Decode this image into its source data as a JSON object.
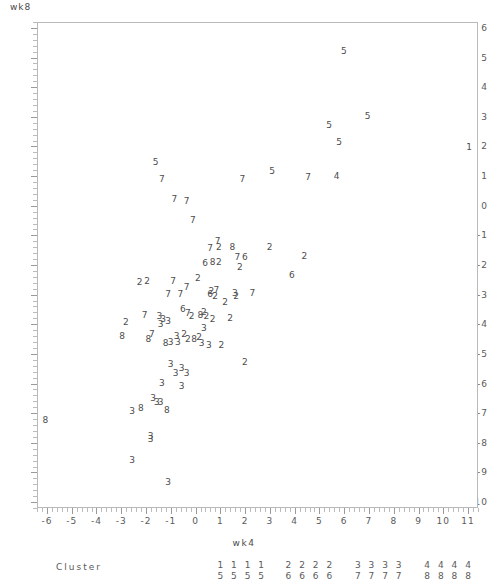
{
  "chart_data": {
    "type": "scatter",
    "title": "",
    "xlabel": "wk4",
    "ylabel": "wk8",
    "xlim": [
      -6.4,
      11.4
    ],
    "ylim": [
      -10.2,
      6.2
    ],
    "grid": false,
    "legend_position": "below-axis",
    "x_ticks": [
      -6,
      -5,
      -4,
      -3,
      -2,
      -1,
      0,
      1,
      2,
      3,
      4,
      5,
      6,
      7,
      8,
      9,
      10,
      11
    ],
    "y_ticks": [
      6,
      5,
      4,
      3,
      2,
      1,
      0,
      -1,
      -2,
      -3,
      -4,
      -5,
      -6,
      -7,
      -8,
      -9,
      -10
    ],
    "marker_style": "cluster-number-glyph",
    "legend": {
      "label": "Cluster",
      "entries": [
        {
          "top": "1",
          "bottom": "5"
        },
        {
          "top": "1",
          "bottom": "5"
        },
        {
          "top": "1",
          "bottom": "5"
        },
        {
          "top": "1",
          "bottom": "5"
        },
        {
          "top": "2",
          "bottom": "6"
        },
        {
          "top": "2",
          "bottom": "6"
        },
        {
          "top": "2",
          "bottom": "6"
        },
        {
          "top": "2",
          "bottom": "6"
        },
        {
          "top": "3",
          "bottom": "7"
        },
        {
          "top": "3",
          "bottom": "7"
        },
        {
          "top": "3",
          "bottom": "7"
        },
        {
          "top": "3",
          "bottom": "7"
        },
        {
          "top": "4",
          "bottom": "8"
        },
        {
          "top": "4",
          "bottom": "8"
        },
        {
          "top": "4",
          "bottom": "8"
        },
        {
          "top": "4",
          "bottom": "8"
        }
      ],
      "entry_x": [
        1,
        1.55,
        2.1,
        2.65,
        3.75,
        4.3,
        4.85,
        5.4,
        6.55,
        7.1,
        7.65,
        8.2,
        9.35,
        9.9,
        10.45,
        11.0
      ]
    },
    "points": [
      {
        "x": 11.0,
        "y": 2.0,
        "label": "1"
      },
      {
        "x": 5.95,
        "y": 5.25,
        "label": "5"
      },
      {
        "x": 6.9,
        "y": 3.05,
        "label": "5"
      },
      {
        "x": 5.35,
        "y": 2.75,
        "label": "5"
      },
      {
        "x": 5.75,
        "y": 2.2,
        "label": "5"
      },
      {
        "x": 3.05,
        "y": 1.2,
        "label": "5"
      },
      {
        "x": -1.65,
        "y": 1.5,
        "label": "5"
      },
      {
        "x": 5.65,
        "y": 1.05,
        "label": "4"
      },
      {
        "x": -1.4,
        "y": 0.95,
        "label": "7"
      },
      {
        "x": -0.9,
        "y": 0.25,
        "label": "7"
      },
      {
        "x": -0.4,
        "y": 0.2,
        "label": "7"
      },
      {
        "x": -0.15,
        "y": -0.45,
        "label": "7"
      },
      {
        "x": 1.85,
        "y": 0.95,
        "label": "7"
      },
      {
        "x": 4.5,
        "y": 1.0,
        "label": "7"
      },
      {
        "x": 0.85,
        "y": -1.15,
        "label": "7"
      },
      {
        "x": 0.55,
        "y": -1.4,
        "label": "7"
      },
      {
        "x": 0.9,
        "y": -1.35,
        "label": "2"
      },
      {
        "x": 1.45,
        "y": -1.35,
        "label": "8"
      },
      {
        "x": 1.65,
        "y": -1.7,
        "label": "7"
      },
      {
        "x": 1.95,
        "y": -1.7,
        "label": "6"
      },
      {
        "x": 0.35,
        "y": -1.9,
        "label": "6"
      },
      {
        "x": 0.65,
        "y": -1.85,
        "label": "8"
      },
      {
        "x": 0.9,
        "y": -1.85,
        "label": "2"
      },
      {
        "x": 1.75,
        "y": -2.05,
        "label": "2"
      },
      {
        "x": 2.95,
        "y": -1.35,
        "label": "2"
      },
      {
        "x": 4.35,
        "y": -1.65,
        "label": "2"
      },
      {
        "x": 3.85,
        "y": -2.3,
        "label": "6"
      },
      {
        "x": -2.3,
        "y": -2.55,
        "label": "2"
      },
      {
        "x": -2.0,
        "y": -2.5,
        "label": "2"
      },
      {
        "x": -0.95,
        "y": -2.5,
        "label": "7"
      },
      {
        "x": -1.15,
        "y": -2.95,
        "label": "7"
      },
      {
        "x": -0.65,
        "y": -2.95,
        "label": "7"
      },
      {
        "x": -0.4,
        "y": -2.7,
        "label": "7"
      },
      {
        "x": 0.05,
        "y": -2.4,
        "label": "2"
      },
      {
        "x": 0.6,
        "y": -2.85,
        "label": "2"
      },
      {
        "x": 0.8,
        "y": -2.8,
        "label": "7"
      },
      {
        "x": 0.55,
        "y": -2.95,
        "label": "6"
      },
      {
        "x": 0.75,
        "y": -3.0,
        "label": "2"
      },
      {
        "x": 1.15,
        "y": -3.2,
        "label": "2"
      },
      {
        "x": 1.55,
        "y": -2.9,
        "label": "3"
      },
      {
        "x": 1.6,
        "y": -3.0,
        "label": "2"
      },
      {
        "x": 2.25,
        "y": -2.9,
        "label": "7"
      },
      {
        "x": -2.85,
        "y": -3.9,
        "label": "2"
      },
      {
        "x": -3.0,
        "y": -4.35,
        "label": "8"
      },
      {
        "x": -2.1,
        "y": -3.65,
        "label": "7"
      },
      {
        "x": -1.5,
        "y": -3.7,
        "label": "3"
      },
      {
        "x": -1.35,
        "y": -3.8,
        "label": "3"
      },
      {
        "x": -1.45,
        "y": -3.95,
        "label": "3"
      },
      {
        "x": -1.15,
        "y": -3.85,
        "label": "3"
      },
      {
        "x": -1.95,
        "y": -4.45,
        "label": "8"
      },
      {
        "x": -1.8,
        "y": -4.3,
        "label": "7"
      },
      {
        "x": -1.25,
        "y": -4.6,
        "label": "8"
      },
      {
        "x": -1.05,
        "y": -4.55,
        "label": "3"
      },
      {
        "x": -0.75,
        "y": -4.55,
        "label": "3"
      },
      {
        "x": -0.8,
        "y": -4.35,
        "label": "3"
      },
      {
        "x": -0.5,
        "y": -4.3,
        "label": "2"
      },
      {
        "x": -0.35,
        "y": -4.45,
        "label": "2"
      },
      {
        "x": -0.1,
        "y": -4.45,
        "label": "8"
      },
      {
        "x": 0.1,
        "y": -4.4,
        "label": "2"
      },
      {
        "x": 0.2,
        "y": -4.6,
        "label": "3"
      },
      {
        "x": 0.5,
        "y": -4.65,
        "label": "3"
      },
      {
        "x": 1.0,
        "y": -4.65,
        "label": "2"
      },
      {
        "x": 0.3,
        "y": -4.1,
        "label": "3"
      },
      {
        "x": -0.35,
        "y": -3.6,
        "label": "7"
      },
      {
        "x": -0.2,
        "y": -3.7,
        "label": "2"
      },
      {
        "x": 0.15,
        "y": -3.65,
        "label": "8"
      },
      {
        "x": 0.4,
        "y": -3.7,
        "label": "2"
      },
      {
        "x": 0.65,
        "y": -3.8,
        "label": "2"
      },
      {
        "x": 0.3,
        "y": -3.55,
        "label": "2"
      },
      {
        "x": 1.35,
        "y": -3.75,
        "label": "2"
      },
      {
        "x": -0.55,
        "y": -3.45,
        "label": "6"
      },
      {
        "x": 1.95,
        "y": -5.25,
        "label": "2"
      },
      {
        "x": -1.05,
        "y": -5.3,
        "label": "3"
      },
      {
        "x": -0.6,
        "y": -5.45,
        "label": "3"
      },
      {
        "x": -0.85,
        "y": -5.6,
        "label": "3"
      },
      {
        "x": -0.4,
        "y": -5.6,
        "label": "3"
      },
      {
        "x": -1.4,
        "y": -5.95,
        "label": "3"
      },
      {
        "x": -0.6,
        "y": -6.05,
        "label": "3"
      },
      {
        "x": -1.75,
        "y": -6.45,
        "label": "3"
      },
      {
        "x": -1.45,
        "y": -6.6,
        "label": "3"
      },
      {
        "x": -2.6,
        "y": -6.9,
        "label": "3"
      },
      {
        "x": -2.25,
        "y": -6.8,
        "label": "8"
      },
      {
        "x": -1.2,
        "y": -6.85,
        "label": "8"
      },
      {
        "x": -1.6,
        "y": -6.6,
        "label": "3"
      },
      {
        "x": -6.1,
        "y": -7.2,
        "label": "8"
      },
      {
        "x": -1.85,
        "y": -7.75,
        "label": "3"
      },
      {
        "x": -1.85,
        "y": -7.85,
        "label": "3"
      },
      {
        "x": -2.6,
        "y": -8.55,
        "label": "3"
      },
      {
        "x": -1.15,
        "y": -9.3,
        "label": "3"
      }
    ]
  }
}
